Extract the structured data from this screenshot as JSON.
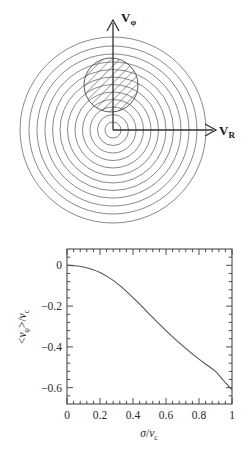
{
  "figure": {
    "panels": [
      {
        "id": "velocity-ellipsoid-diagram",
        "type": "schematic",
        "axes": {
          "vertical_label": "V",
          "vertical_sub": "φ",
          "horizontal_label": "V",
          "horizontal_sub": "R"
        },
        "contours": {
          "description": "concentric circular velocity contours centred on origin",
          "count": 12,
          "center": [
            113,
            130
          ],
          "radii": [
            8,
            15.5,
            23,
            30.5,
            38,
            45.5,
            53,
            60.5,
            68,
            76,
            84,
            93
          ]
        },
        "hatched_region": {
          "description": "hatched circle offset along +V_phi",
          "center": [
            111,
            85
          ],
          "radius": 27,
          "hatch_angle_deg": 45
        }
      },
      {
        "id": "mean-rotation-plot",
        "type": "line-plot"
      }
    ]
  },
  "chart_data": {
    "type": "line",
    "title": "",
    "xlabel": "σ/v_c",
    "ylabel": "<v_φ>/v_c",
    "xlabel_parts": {
      "sigma": "σ",
      "slash": "/",
      "v": "v",
      "sub": "c"
    },
    "ylabel_parts": {
      "open": "<",
      "v": "v",
      "vsub": "φ",
      "close": ">",
      "slash": "/",
      "v2": "v",
      "v2sub": "c"
    },
    "xlim": [
      0,
      1
    ],
    "ylim": [
      -0.68,
      0.08
    ],
    "grid": false,
    "legend": "none",
    "xticks": [
      0,
      0.2,
      0.4,
      0.6,
      0.8,
      1
    ],
    "xticklabels": [
      "0",
      "0.2",
      "0.4",
      "0.6",
      "0.8",
      "1"
    ],
    "yticks": [
      0,
      -0.2,
      -0.4,
      -0.6
    ],
    "yticklabels": [
      "0",
      "−0.2",
      "−0.4",
      "−0.6"
    ],
    "minor_ticks_x": 5,
    "minor_ticks_y": 5,
    "series": [
      {
        "name": "mean azimuthal velocity",
        "x": [
          0,
          0.05,
          0.1,
          0.15,
          0.2,
          0.25,
          0.3,
          0.35,
          0.4,
          0.45,
          0.5,
          0.55,
          0.6,
          0.65,
          0.7,
          0.75,
          0.8,
          0.85,
          0.9,
          0.95,
          1.0
        ],
        "y": [
          0.0,
          -0.002,
          -0.008,
          -0.019,
          -0.035,
          -0.058,
          -0.086,
          -0.12,
          -0.158,
          -0.198,
          -0.24,
          -0.281,
          -0.32,
          -0.358,
          -0.394,
          -0.428,
          -0.46,
          -0.49,
          -0.52,
          -0.566,
          -0.611
        ]
      }
    ]
  },
  "style": {
    "line_color": "#555555",
    "axis_color": "#3a3a3a",
    "contour_color": "#6b6b6b",
    "hatch_color": "#4a4a4a"
  }
}
